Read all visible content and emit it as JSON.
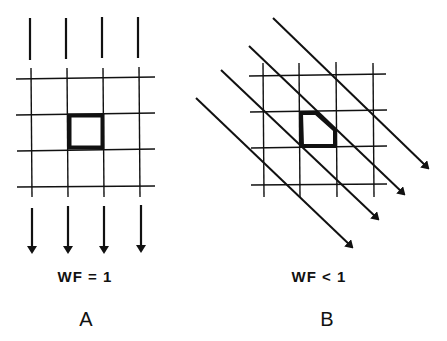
{
  "panels": [
    {
      "id": "A",
      "label": "A",
      "caption": "WF = 1",
      "description": "Parallel vertical flow lines crossing a square grid; highlighted grid cell remains a full square"
    },
    {
      "id": "B",
      "label": "B",
      "caption": "WF < 1",
      "description": "Diagonal flow lines crossing a square grid; highlighted grid cell is clipped into a pentagon"
    }
  ],
  "colors": {
    "line": "#111111",
    "background": "#ffffff"
  }
}
